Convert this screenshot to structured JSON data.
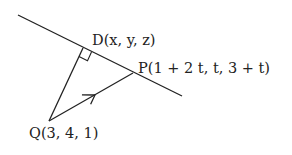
{
  "diagram": {
    "type": "geometry-perpendicular-from-point-to-line",
    "points": {
      "D": {
        "name": "D",
        "coords": "(x, y, z)",
        "label": "D(x, y, z)"
      },
      "P": {
        "name": "P",
        "coords": "(1 + 2 t, t, 3 + t)",
        "label": "P(1 + 2 t, t, 3 + t)"
      },
      "Q": {
        "name": "Q",
        "coords": "(3, 4, 1)",
        "label": "Q(3, 4, 1)"
      }
    },
    "elements": [
      "line through D and P",
      "segment QD (perpendicular to line)",
      "right-angle marker at D",
      "vector QP with arrow"
    ],
    "stroke_color": "#222222",
    "background": "#ffffff"
  }
}
